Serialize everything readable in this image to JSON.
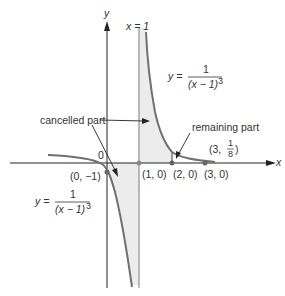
{
  "figure": {
    "axes": {
      "x_label": "x",
      "y_label": "y",
      "origin_label": "0"
    },
    "asymptote": {
      "label": "x = 1"
    },
    "equation_upper": {
      "lhs": "y =",
      "numerator": "1",
      "denominator": "(x − 1)",
      "exponent": "3"
    },
    "equation_lower": {
      "lhs": "y =",
      "numerator": "1",
      "denominator": "(x − 1)",
      "exponent": "3"
    },
    "annotations": {
      "cancelled": "cancelled part",
      "remaining": "remaining part"
    },
    "points": [
      {
        "label": "(0, −1)"
      },
      {
        "label": "(1, 0)"
      },
      {
        "label": "(2, 0)"
      },
      {
        "label": "(3, 0)"
      }
    ],
    "point_3_eighth": {
      "prefix": "(3,",
      "num": "1",
      "den": "8",
      "suffix": ")"
    }
  },
  "colors": {
    "curve": "#707070",
    "axis": "#222222",
    "shade": "#ececec",
    "line": "#999999"
  }
}
